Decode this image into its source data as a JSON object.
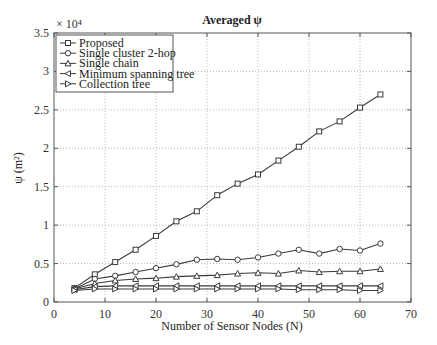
{
  "chart_data": {
    "type": "line",
    "title": "Averaged ψ",
    "xlabel": "Number of Sensor Nodes (N)",
    "ylabel": "ψ (m²)",
    "y_multiplier": "× 10⁴",
    "xlim": [
      0,
      70
    ],
    "ylim": [
      0,
      3.5
    ],
    "xticks": [
      0,
      10,
      20,
      30,
      40,
      50,
      60,
      70
    ],
    "yticks": [
      0,
      0.5,
      1,
      1.5,
      2,
      2.5,
      3,
      3.5
    ],
    "grid": true,
    "legend_position": "upper left",
    "x": [
      4,
      8,
      12,
      16,
      20,
      24,
      28,
      32,
      36,
      40,
      44,
      48,
      52,
      56,
      60,
      64
    ],
    "series": [
      {
        "name": "Proposed",
        "marker": "square",
        "values": [
          0.18,
          0.36,
          0.52,
          0.68,
          0.86,
          1.05,
          1.18,
          1.39,
          1.54,
          1.66,
          1.84,
          2.02,
          2.22,
          2.35,
          2.53,
          2.7
        ]
      },
      {
        "name": "Single cluster 2-hop",
        "marker": "circle",
        "values": [
          0.17,
          0.3,
          0.34,
          0.39,
          0.44,
          0.49,
          0.55,
          0.56,
          0.55,
          0.58,
          0.63,
          0.68,
          0.63,
          0.69,
          0.67,
          0.76
        ]
      },
      {
        "name": "Single chain",
        "marker": "triangle-up",
        "values": [
          0.17,
          0.24,
          0.28,
          0.3,
          0.31,
          0.33,
          0.34,
          0.35,
          0.37,
          0.38,
          0.37,
          0.41,
          0.39,
          0.4,
          0.4,
          0.43
        ]
      },
      {
        "name": "Minimum spanning tree",
        "marker": "triangle-left",
        "values": [
          0.16,
          0.2,
          0.21,
          0.21,
          0.21,
          0.21,
          0.21,
          0.21,
          0.21,
          0.21,
          0.21,
          0.21,
          0.21,
          0.21,
          0.21,
          0.21
        ]
      },
      {
        "name": "Collection tree",
        "marker": "triangle-right",
        "values": [
          0.15,
          0.17,
          0.17,
          0.17,
          0.17,
          0.17,
          0.17,
          0.17,
          0.17,
          0.17,
          0.17,
          0.16,
          0.16,
          0.16,
          0.15,
          0.15
        ]
      }
    ]
  },
  "colors": {
    "line": "#3a3a3a",
    "grid": "#b8b8b8",
    "axis": "#555555"
  }
}
